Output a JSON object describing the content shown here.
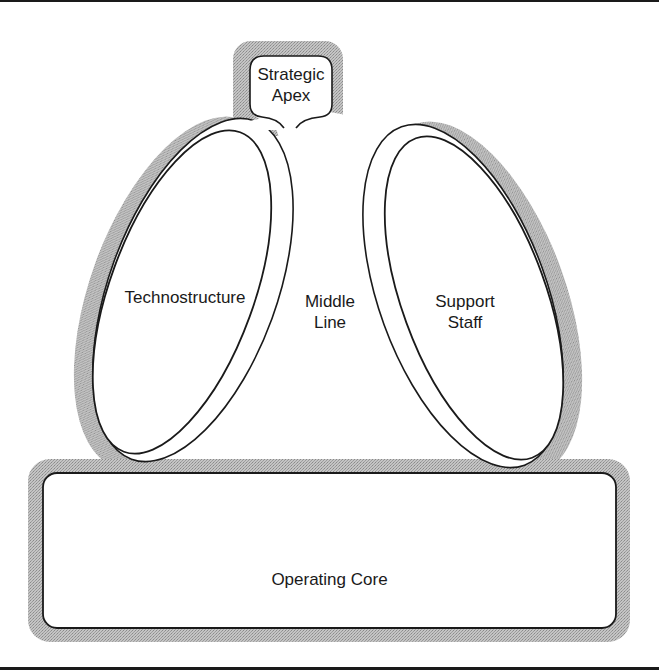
{
  "diagram": {
    "type": "organizational-structure",
    "parts": {
      "strategic_apex": {
        "line1": "Strategic",
        "line2": "Apex"
      },
      "technostructure": {
        "label": "Technostructure"
      },
      "middle_line": {
        "line1": "Middle",
        "line2": "Line"
      },
      "support_staff": {
        "line1": "Support",
        "line2": "Staff"
      },
      "operating_core": {
        "label": "Operating Core"
      }
    },
    "colors": {
      "outline": "#1a1a1a",
      "halo": "#b8b8b8",
      "fill": "#ffffff"
    }
  }
}
